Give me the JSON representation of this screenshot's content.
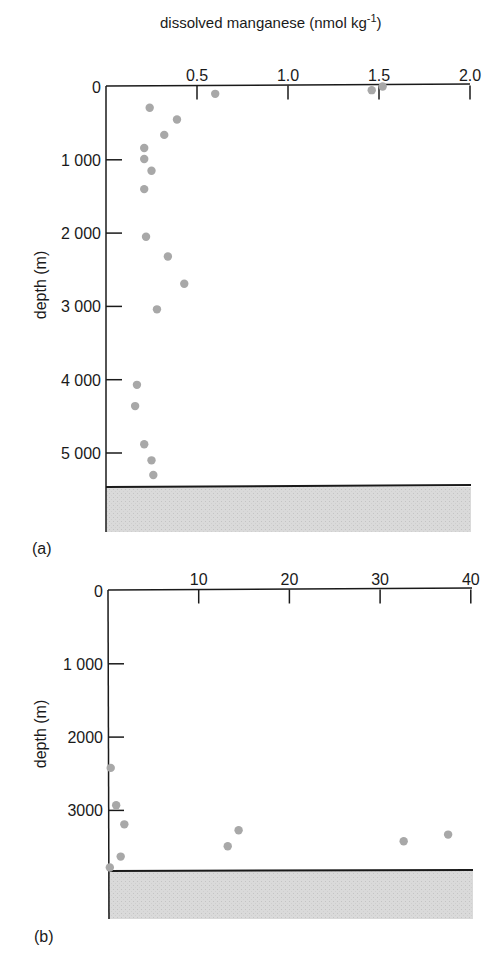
{
  "figure": {
    "title": "dissolved manganese (nmol kg",
    "title_sup": "-1",
    "title_close": ")",
    "ylabel": "depth (m)",
    "panel_a_label": "(a)",
    "panel_b_label": "(b)"
  },
  "colors": {
    "point": "#a8a8a8",
    "axis": "#1a1a1a",
    "seafloor": "#d6d6d6"
  },
  "chart_data": [
    {
      "type": "scatter",
      "panel": "(a)",
      "title": "dissolved manganese (nmol kg-1)",
      "xlabel": "dissolved manganese (nmol kg-1)",
      "ylabel": "depth (m)",
      "xlim": [
        0,
        2.0
      ],
      "ylim": [
        0,
        6000
      ],
      "y_inverted": true,
      "x_ticks": [
        0,
        0.5,
        1.0,
        1.5,
        2.0
      ],
      "x_tick_labels": [
        "",
        "0.5",
        "1.0",
        "1.5",
        "2.0"
      ],
      "y_ticks": [
        0,
        1000,
        2000,
        3000,
        4000,
        5000
      ],
      "y_tick_labels": [
        "0",
        "1 000",
        "2 000",
        "3 000",
        "4 000",
        "5 000"
      ],
      "seafloor_depth": 5370,
      "grid": false,
      "points": [
        {
          "x": 1.52,
          "y": 0
        },
        {
          "x": 1.46,
          "y": 50
        },
        {
          "x": 0.6,
          "y": 100
        },
        {
          "x": 0.24,
          "y": 290
        },
        {
          "x": 0.39,
          "y": 450
        },
        {
          "x": 0.32,
          "y": 660
        },
        {
          "x": 0.21,
          "y": 840
        },
        {
          "x": 0.21,
          "y": 990
        },
        {
          "x": 0.25,
          "y": 1150
        },
        {
          "x": 0.21,
          "y": 1400
        },
        {
          "x": 0.22,
          "y": 2050
        },
        {
          "x": 0.34,
          "y": 2320
        },
        {
          "x": 0.43,
          "y": 2690
        },
        {
          "x": 0.28,
          "y": 3040
        },
        {
          "x": 0.17,
          "y": 4070
        },
        {
          "x": 0.16,
          "y": 4360
        },
        {
          "x": 0.21,
          "y": 4880
        },
        {
          "x": 0.25,
          "y": 5100
        },
        {
          "x": 0.26,
          "y": 5300
        }
      ]
    },
    {
      "type": "scatter",
      "panel": "(b)",
      "xlabel": "dissolved manganese (nmol kg-1)",
      "ylabel": "depth (m)",
      "xlim": [
        0,
        40
      ],
      "ylim": [
        0,
        4500
      ],
      "y_inverted": true,
      "x_ticks": [
        0,
        10,
        20,
        30,
        40
      ],
      "x_tick_labels": [
        "",
        "10",
        "20",
        "30",
        "40"
      ],
      "y_ticks": [
        0,
        1000,
        2000,
        3000
      ],
      "y_tick_labels": [
        "0",
        "1 000",
        "2000",
        "3000"
      ],
      "seafloor_depth": 3840,
      "grid": false,
      "points": [
        {
          "x": 0.3,
          "y": 2420
        },
        {
          "x": 0.9,
          "y": 2930
        },
        {
          "x": 1.8,
          "y": 3190
        },
        {
          "x": 14.4,
          "y": 3270
        },
        {
          "x": 37.5,
          "y": 3330
        },
        {
          "x": 32.6,
          "y": 3420
        },
        {
          "x": 13.2,
          "y": 3490
        },
        {
          "x": 1.4,
          "y": 3630
        },
        {
          "x": 0.2,
          "y": 3780
        }
      ]
    }
  ]
}
